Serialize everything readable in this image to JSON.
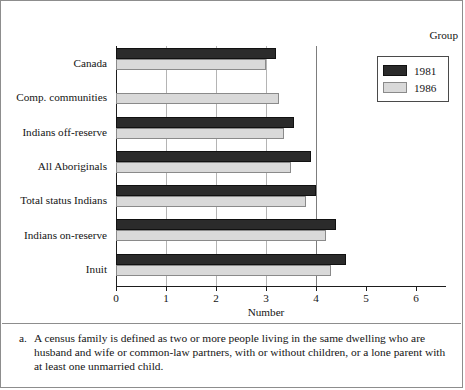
{
  "figure": {
    "axis_title_group": "Group",
    "xlabel": "Number"
  },
  "legend": {
    "items": [
      {
        "label": "1981",
        "key": "s1981",
        "color": "#2b2b2b"
      },
      {
        "label": "1986",
        "key": "s1986",
        "color": "#d9d9d9"
      }
    ]
  },
  "footnote": {
    "marker": "a.",
    "text": "A census family is defined as two or more people living in the same dwelling who are husband and wife or common-law partners, with or without children, or a lone parent with at least one unmarried child."
  },
  "chart_data": {
    "type": "bar",
    "orientation": "horizontal",
    "title": "",
    "subtitle": "",
    "xlabel": "Number",
    "ylabel": "Group",
    "xlim": [
      0,
      6
    ],
    "xticks": [
      0,
      1,
      2,
      3,
      4,
      5,
      6
    ],
    "xtick_labels": [
      "0",
      "1",
      "2",
      "3",
      "4",
      "5",
      "6"
    ],
    "grid": true,
    "gridlines_x": [
      1,
      2,
      3,
      4
    ],
    "legend_position": "right",
    "categories": [
      "Canada",
      "Comp. communities",
      "Indians off-reserve",
      "All Aboriginals",
      "Total status Indians",
      "Indians on-reserve",
      "Inuit"
    ],
    "series": [
      {
        "name": "1981",
        "color": "#2b2b2b",
        "values": [
          3.2,
          null,
          3.55,
          3.9,
          4.0,
          4.4,
          4.6
        ]
      },
      {
        "name": "1986",
        "color": "#d9d9d9",
        "values": [
          3.0,
          3.25,
          3.35,
          3.5,
          3.8,
          4.2,
          4.3
        ]
      }
    ]
  }
}
